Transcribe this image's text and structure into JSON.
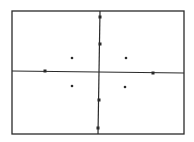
{
  "diagram": {
    "type": "coordinate-crosshair-with-points",
    "stroke_color": "#2a2a2a",
    "background_color": "#ffffff",
    "frame": {
      "x1": 12,
      "y1": 11,
      "x2": 184,
      "y2": 134
    },
    "horizontal_axis": {
      "x1": 12,
      "y1": 71,
      "x2": 184,
      "y2": 73
    },
    "vertical_axis": {
      "x1": 100,
      "y1": 11,
      "x2": 98,
      "y2": 134
    },
    "axis_ticks": [
      {
        "name": "tick-top-outer",
        "x": 100,
        "y": 17
      },
      {
        "name": "tick-top-inner",
        "x": 100,
        "y": 44
      },
      {
        "name": "tick-bottom-inner",
        "x": 99,
        "y": 100
      },
      {
        "name": "tick-bottom-outer",
        "x": 98,
        "y": 128
      },
      {
        "name": "tick-left",
        "x": 45,
        "y": 71
      },
      {
        "name": "tick-right",
        "x": 153,
        "y": 73
      }
    ],
    "points": [
      {
        "name": "point-upper-left",
        "x": 72,
        "y": 58
      },
      {
        "name": "point-upper-right",
        "x": 126,
        "y": 58
      },
      {
        "name": "point-lower-left",
        "x": 72,
        "y": 86
      },
      {
        "name": "point-lower-right",
        "x": 125,
        "y": 87
      }
    ]
  }
}
